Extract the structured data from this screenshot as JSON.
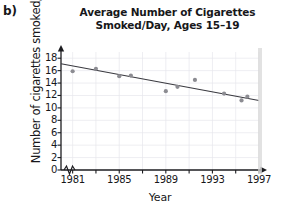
{
  "part_label": "b)",
  "chart_data": {
    "type": "scatter",
    "title": "Average Number of Cigarettes Smoked/Day, Ages 15–19",
    "title_lines": [
      "Average Number of Cigarettes",
      "Smoked/Day, Ages 15–19"
    ],
    "xlabel": "Year",
    "ylabel": "Number of cigarettes smoked/day",
    "xlim": [
      1980,
      1997
    ],
    "ylim": [
      0,
      19
    ],
    "xticks": [
      1981,
      1983,
      1985,
      1987,
      1989,
      1991,
      1993,
      1995,
      1997
    ],
    "xtick_labels": [
      "1981",
      "1985",
      "1989",
      "1993",
      "1997"
    ],
    "xtick_label_values": [
      1981,
      1985,
      1989,
      1993,
      1997
    ],
    "yticks": [
      0,
      2,
      4,
      6,
      8,
      10,
      12,
      14,
      16,
      18
    ],
    "ytick_labels": [
      "0",
      "2",
      "4",
      "6",
      "8",
      "10",
      "12",
      "14",
      "16",
      "18"
    ],
    "grid": true,
    "legend": "none",
    "axis_break_x": true,
    "point_color": "#8c8c92",
    "line_color": "#3a3a40",
    "grid_color": "#e6e6ec",
    "axis_color": "#1c1c20",
    "x": [
      1981,
      1983,
      1985,
      1986,
      1989,
      1990,
      1991.5,
      1994,
      1995.5,
      1996
    ],
    "y": [
      15.9,
      16.3,
      15.1,
      15.2,
      12.7,
      13.4,
      14.5,
      12.3,
      11.2,
      11.8
    ],
    "points": [
      {
        "year": 1981,
        "value": 15.9
      },
      {
        "year": 1983,
        "value": 16.3
      },
      {
        "year": 1985,
        "value": 15.1
      },
      {
        "year": 1986,
        "value": 15.2
      },
      {
        "year": 1989,
        "value": 12.7
      },
      {
        "year": 1990,
        "value": 13.4
      },
      {
        "year": 1991.5,
        "value": 14.5
      },
      {
        "year": 1994,
        "value": 12.3
      },
      {
        "year": 1995.5,
        "value": 11.2
      },
      {
        "year": 1996,
        "value": 11.8
      }
    ],
    "trend_line": {
      "x_start": 1980,
      "y_start": 17.1,
      "x_end": 1997,
      "y_end": 11.2
    }
  }
}
